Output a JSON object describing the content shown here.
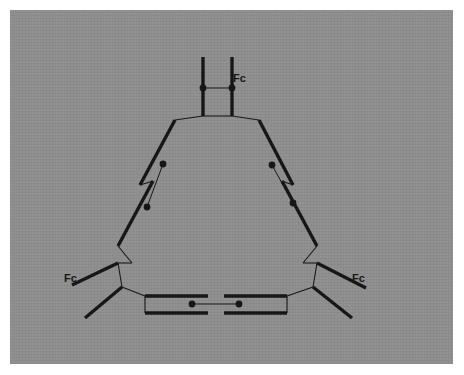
{
  "figure": {
    "background_color": "#8e8e8e",
    "plate_border_color": "#ffffff",
    "ink_color": "#121212",
    "canvas": {
      "width": 464,
      "height": 375
    }
  },
  "labels": [
    {
      "id": "fc-top",
      "text": "Fc",
      "x": 233,
      "y": 82
    },
    {
      "id": "fc-left",
      "text": "Fc",
      "x": 64,
      "y": 282
    },
    {
      "id": "fc-right",
      "text": "Fc",
      "x": 352,
      "y": 282
    }
  ],
  "ferrocenes": [
    {
      "id": "ferrocene-top",
      "label": "Fc",
      "ring_a": {
        "x1": 203,
        "y1": 57,
        "x2": 203,
        "y2": 116
      },
      "ring_b": {
        "x1": 232,
        "y1": 57,
        "x2": 232,
        "y2": 116
      },
      "iron_bond": {
        "x1": 203,
        "y1": 88,
        "x2": 232,
        "y2": 88
      },
      "iron_dots": [
        {
          "cx": 203,
          "cy": 88
        },
        {
          "cx": 232,
          "cy": 88
        }
      ]
    },
    {
      "id": "ferrocene-left",
      "label": "Fc",
      "ring_a": {
        "x1": 175,
        "y1": 120,
        "x2": 140,
        "y2": 185
      },
      "ring_b": {
        "x1": 153,
        "y1": 181,
        "x2": 118,
        "y2": 246
      },
      "iron_bond": {
        "x1": 163,
        "y1": 164,
        "x2": 147,
        "y2": 207
      },
      "iron_dots": [
        {
          "cx": 163,
          "cy": 164
        },
        {
          "cx": 147,
          "cy": 207
        }
      ]
    },
    {
      "id": "ferrocene-right",
      "label": "Fc",
      "ring_a": {
        "x1": 259,
        "y1": 120,
        "x2": 293,
        "y2": 185
      },
      "ring_b": {
        "x1": 282,
        "y1": 181,
        "x2": 317,
        "y2": 246
      },
      "iron_bond": {
        "x1": 272,
        "y1": 165,
        "x2": 293,
        "y2": 203
      },
      "iron_dots": [
        {
          "cx": 272,
          "cy": 165
        },
        {
          "cx": 293,
          "cy": 203
        }
      ]
    },
    {
      "id": "ferrocene-bottom",
      "label": "Fc",
      "ring_a": {
        "x1": 145,
        "y1": 296,
        "x2": 208,
        "y2": 296
      },
      "ring_b": {
        "x1": 224,
        "y1": 296,
        "x2": 287,
        "y2": 296
      },
      "iron_bond": {
        "x1": 192,
        "y1": 304,
        "x2": 239,
        "y2": 304
      },
      "iron_dots": [
        {
          "cx": 192,
          "cy": 304
        },
        {
          "cx": 239,
          "cy": 304
        }
      ]
    }
  ],
  "bold_bonds": [
    {
      "id": "bond-top-ring-a",
      "x1": 203,
      "y1": 57,
      "x2": 203,
      "y2": 116
    },
    {
      "id": "bond-top-ring-b",
      "x1": 232,
      "y1": 57,
      "x2": 232,
      "y2": 116
    },
    {
      "id": "bond-left-ring-upper",
      "x1": 175,
      "y1": 120,
      "x2": 140,
      "y2": 185
    },
    {
      "id": "bond-left-ring-lower",
      "x1": 153,
      "y1": 181,
      "x2": 118,
      "y2": 246
    },
    {
      "id": "bond-right-ring-upper",
      "x1": 259,
      "y1": 120,
      "x2": 293,
      "y2": 185
    },
    {
      "id": "bond-right-ring-lower",
      "x1": 282,
      "y1": 181,
      "x2": 317,
      "y2": 246
    },
    {
      "id": "bond-bottom-ring-left",
      "x1": 145,
      "y1": 296,
      "x2": 208,
      "y2": 296
    },
    {
      "id": "bond-bottom-ring-right",
      "x1": 224,
      "y1": 296,
      "x2": 287,
      "y2": 296
    },
    {
      "id": "bond-bottom-ring-left-lower",
      "x1": 145,
      "y1": 313,
      "x2": 208,
      "y2": 313
    },
    {
      "id": "bond-bottom-ring-right-lower",
      "x1": 224,
      "y1": 313,
      "x2": 287,
      "y2": 313
    },
    {
      "id": "bond-vertex-left-arm-upper",
      "x1": 118,
      "y1": 263,
      "x2": 72,
      "y2": 285
    },
    {
      "id": "bond-vertex-left-arm-lower",
      "x1": 122,
      "y1": 287,
      "x2": 85,
      "y2": 318
    },
    {
      "id": "bond-vertex-right-arm-upper",
      "x1": 317,
      "y1": 263,
      "x2": 366,
      "y2": 288
    },
    {
      "id": "bond-vertex-right-arm-lower",
      "x1": 313,
      "y1": 287,
      "x2": 352,
      "y2": 318
    }
  ],
  "thin_bonds": [
    {
      "id": "link-top-center",
      "x1": 203,
      "y1": 116,
      "x2": 232,
      "y2": 116
    },
    {
      "id": "link-top-left-ring",
      "x1": 203,
      "y1": 116,
      "x2": 175,
      "y2": 120
    },
    {
      "id": "link-top-right-ring",
      "x1": 232,
      "y1": 116,
      "x2": 259,
      "y2": 120
    },
    {
      "id": "link-left-rings",
      "x1": 140,
      "y1": 185,
      "x2": 153,
      "y2": 181
    },
    {
      "id": "link-right-rings",
      "x1": 293,
      "y1": 185,
      "x2": 282,
      "y2": 181
    },
    {
      "id": "link-left-vertex-a",
      "x1": 118,
      "y1": 246,
      "x2": 132,
      "y2": 263
    },
    {
      "id": "link-left-vertex-b",
      "x1": 132,
      "y1": 263,
      "x2": 118,
      "y2": 263
    },
    {
      "id": "link-left-vertex-c",
      "x1": 118,
      "y1": 263,
      "x2": 122,
      "y2": 287
    },
    {
      "id": "link-left-to-bottom",
      "x1": 122,
      "y1": 287,
      "x2": 145,
      "y2": 296
    },
    {
      "id": "link-left-bottom-edge",
      "x1": 145,
      "y1": 296,
      "x2": 145,
      "y2": 313
    },
    {
      "id": "link-right-vertex-a",
      "x1": 317,
      "y1": 246,
      "x2": 303,
      "y2": 263
    },
    {
      "id": "link-right-vertex-b",
      "x1": 303,
      "y1": 263,
      "x2": 317,
      "y2": 263
    },
    {
      "id": "link-right-vertex-c",
      "x1": 317,
      "y1": 263,
      "x2": 313,
      "y2": 287
    },
    {
      "id": "link-right-to-bottom",
      "x1": 313,
      "y1": 287,
      "x2": 287,
      "y2": 296
    },
    {
      "id": "link-right-bottom-edge",
      "x1": 287,
      "y1": 296,
      "x2": 287,
      "y2": 313
    }
  ]
}
